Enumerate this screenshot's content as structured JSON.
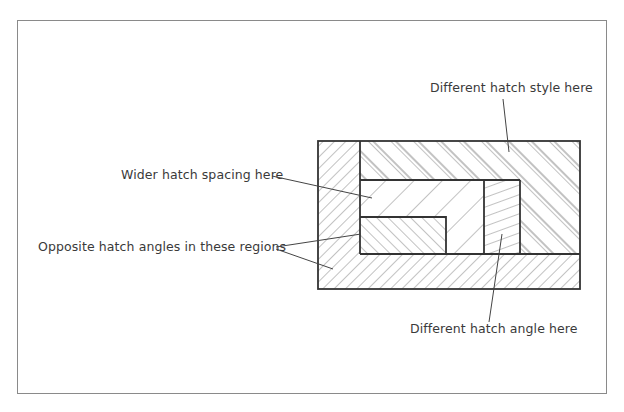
{
  "diagram": {
    "colors": {
      "frame": "#8a8a8a",
      "outline": "#333333",
      "hatch": "#777777",
      "leader": "#444444",
      "text": "#3a3a3a"
    },
    "labels": {
      "hatch_style": "Different hatch style here",
      "wider_spacing": "Wider hatch spacing here",
      "opposite_angles": "Opposite hatch angles in these regions",
      "hatch_angle": "Different hatch angle here"
    },
    "regions": [
      {
        "name": "left-column",
        "hatch": "45° forward, fine spacing"
      },
      {
        "name": "bottom-bar",
        "hatch": "45° forward, fine spacing"
      },
      {
        "name": "top-frame-region",
        "hatch": "paired backward diagonals (different style)"
      },
      {
        "name": "wide-spacing-region",
        "hatch": "45° forward, wide spacing"
      },
      {
        "name": "lower-left-inner",
        "hatch": "45° backward, fine spacing (opposite angle)"
      },
      {
        "name": "right-inner-box",
        "hatch": "shallow ~20° rising lines (different angle)"
      }
    ]
  }
}
